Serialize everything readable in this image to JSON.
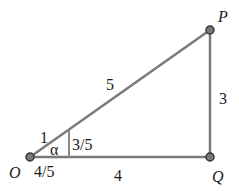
{
  "diagram": {
    "colors": {
      "edge": "#7a7a7a",
      "point_fill": "#7a7a7a",
      "point_stroke": "#333333",
      "text": "#1a1a1a"
    },
    "points": {
      "O": {
        "label": "O",
        "x": 30,
        "y": 157
      },
      "P": {
        "label": "P",
        "x": 210,
        "y": 30
      },
      "Q": {
        "label": "Q",
        "x": 210,
        "y": 157
      }
    },
    "edges": {
      "OP": {
        "label": "5"
      },
      "PQ": {
        "label": "3"
      },
      "OQ": {
        "label": "4"
      }
    },
    "small_triangle": {
      "hypotenuse_label": "1",
      "opposite_label": "3/5",
      "adjacent_label": "4/5",
      "angle_label": "α"
    }
  }
}
